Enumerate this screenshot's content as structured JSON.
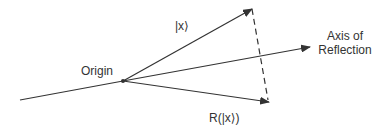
{
  "diagram": {
    "labels": {
      "origin": "Origin",
      "ket_x": "|x⟩",
      "axis_line1": "Axis of",
      "axis_line2": "Reflection",
      "reflected": "R(|x⟩)"
    },
    "colors": {
      "stroke": "#333333",
      "background": "#ffffff"
    },
    "points": {
      "line_start": [
        20,
        100
      ],
      "origin": [
        123,
        81
      ],
      "ket_x_tip": [
        252,
        9
      ],
      "axis_tip": [
        310,
        47
      ],
      "reflected_tip": [
        269,
        102
      ]
    }
  }
}
